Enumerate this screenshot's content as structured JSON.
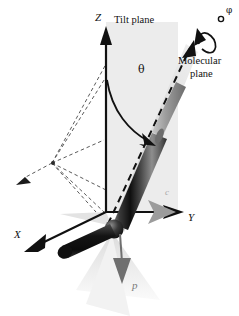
{
  "figure": {
    "domain": "diagram",
    "background_color": "#ffffff",
    "width": 239,
    "height": 316
  },
  "axes": [
    {
      "id": "z-axis",
      "label": "Z",
      "direction": "up",
      "label_x": 98,
      "label_y": 19,
      "style": "italic-serif",
      "color": "#111111"
    },
    {
      "id": "y-axis",
      "label": "Y",
      "direction": "right",
      "label_x": 190,
      "label_y": 219,
      "style": "italic-serif",
      "color": "#111111"
    },
    {
      "id": "x-axis",
      "label": "X",
      "direction": "down-left",
      "label_x": 16,
      "label_y": 236,
      "style": "italic-serif",
      "color": "#111111"
    }
  ],
  "labels": [
    {
      "id": "tilt-plane-label",
      "text": "Tilt plane",
      "x": 115,
      "y": 21,
      "color": "#111111",
      "size": 10.5
    },
    {
      "id": "molecular-plane-label-line1",
      "text": "Molecular",
      "x": 182,
      "y": 62,
      "color": "#111111",
      "size": 10.5
    },
    {
      "id": "molecular-plane-label-line2",
      "text": "plane",
      "x": 190,
      "y": 75,
      "color": "#111111",
      "size": 10.5
    },
    {
      "id": "theta-label",
      "text": "θ",
      "x": 140,
      "y": 72,
      "color": "#111111",
      "size": 11
    },
    {
      "id": "phi-label",
      "text": "φ",
      "x": 224,
      "y": 14,
      "color": "#111111",
      "size": 9
    },
    {
      "id": "polarization-label",
      "text": "p",
      "x": 134,
      "y": 283,
      "color": "#6f6f6f",
      "size": 11
    },
    {
      "id": "c-director-label",
      "text": "c",
      "x": 166,
      "y": 193,
      "color": "#a8a8a8",
      "size": 9
    }
  ],
  "geometry": {
    "origin": {
      "x": 106,
      "y": 212
    },
    "tilt_plane": {
      "fill": "#ededed",
      "points": "106,22 178,22 178,212 106,212",
      "description": "vertical gray rectangle containing Z axis and molecular long axis"
    },
    "molecular_plane": {
      "fill": "#dcdcdc",
      "description": "light gray wedge along the molecular long axis"
    },
    "shadow_plane": {
      "fill": "#ececec",
      "description": "pale wedge below origin toward viewer"
    },
    "molecule_rod": {
      "color_dark": "#1b1b1b",
      "color_mid": "#6a6a6a",
      "color_light": "#b9b9b9",
      "description": "dark shaded cylinder from origin up-right"
    },
    "tail_rod": {
      "color": "#141414",
      "description": "short textured cylinder from origin down-left"
    },
    "joint_sphere": {
      "color": "#2a2a2a",
      "cx": 113,
      "cy": 228,
      "r": 9
    },
    "dashed_projection": {
      "color": "#555555",
      "dash": "4 3",
      "vertex": {
        "x": 52,
        "y": 163
      },
      "description": "dashed fan of projection lines to the left of the origin"
    },
    "theta_arc": {
      "color": "#111111",
      "description": "curved arrow from Z axis to molecular axis"
    },
    "phi_arc": {
      "color": "#111111",
      "description": "curved rotation arrow around molecular axis at the top"
    },
    "p_vector": {
      "color": "#6f6f6f",
      "description": "gray downward arrow from joint sphere"
    },
    "c_vector": {
      "color": "#9a9a9a",
      "description": "gray arrow along Y overlapping black Y arrow"
    }
  }
}
